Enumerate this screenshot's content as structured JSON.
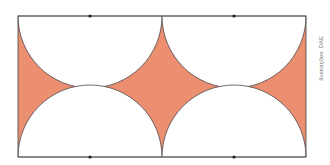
{
  "figure": {
    "rectangle": {
      "x": 18,
      "y": 16,
      "width": 288,
      "height": 141
    },
    "semicircle_radius": 72,
    "top_centers_x": [
      90,
      234
    ],
    "bottom_centers_x": [
      90,
      234
    ],
    "colors": {
      "fill": "#ec8f70",
      "stroke": "#4a4a4a",
      "background": "#ffffff"
    },
    "center_points": [
      {
        "x": 90,
        "y": 16
      },
      {
        "x": 234,
        "y": 16
      },
      {
        "x": 90,
        "y": 157
      },
      {
        "x": 234,
        "y": 157
      }
    ]
  },
  "credit": "Ilustrações: DAE"
}
